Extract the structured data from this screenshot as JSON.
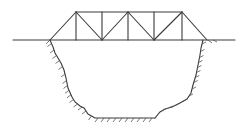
{
  "diagram": {
    "type": "truss-bridge-over-gorge",
    "colors": {
      "line": "#3a3a3a",
      "background": "#ffffff"
    },
    "ground": {
      "y": 40,
      "x1": 13,
      "x2": 235
    },
    "truss": {
      "top_y": 12,
      "bottom_y": 40,
      "top_nodes_x": [
        76,
        102,
        128,
        154,
        182
      ],
      "bottom_nodes_x": [
        50,
        76,
        102,
        128,
        154,
        182,
        207
      ]
    },
    "gorge_outline": [
      [
        50,
        40
      ],
      [
        53,
        47
      ],
      [
        55,
        53
      ],
      [
        58,
        58
      ],
      [
        61,
        63
      ],
      [
        64,
        70
      ],
      [
        66,
        78
      ],
      [
        68,
        88
      ],
      [
        72,
        97
      ],
      [
        75,
        102
      ],
      [
        80,
        106
      ],
      [
        84,
        108
      ],
      [
        88,
        114
      ],
      [
        95,
        118
      ],
      [
        125,
        118
      ],
      [
        155,
        118
      ],
      [
        160,
        112
      ],
      [
        165,
        109
      ],
      [
        172,
        107
      ],
      [
        180,
        103
      ],
      [
        187,
        99
      ],
      [
        191,
        93
      ],
      [
        193,
        85
      ],
      [
        196,
        75
      ],
      [
        198,
        65
      ],
      [
        200,
        55
      ],
      [
        201,
        48
      ],
      [
        203,
        40
      ]
    ]
  }
}
